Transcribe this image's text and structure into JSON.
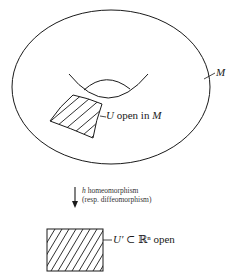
{
  "figure": {
    "manifold_label": "M",
    "open_set_label": {
      "var": "U",
      "text": " open in ",
      "space": "M"
    },
    "map": {
      "var": "h",
      "line1_rest": " homeomorphism",
      "line2": "(resp. diffeomorphism)"
    },
    "chart_set_label": {
      "var": "U′",
      "subset": " ⊂ ",
      "space": "ℝⁿ",
      "rest": " open"
    },
    "colors": {
      "stroke": "#1a1a1a",
      "background": "#ffffff"
    }
  }
}
